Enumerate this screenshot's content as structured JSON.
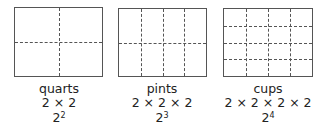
{
  "panels": [
    {
      "name": "quarts",
      "product": "2 × 2",
      "base": "2",
      "exponent": "2",
      "rect": {
        "left": 14,
        "top": 7,
        "width": 89,
        "height": 70
      },
      "cols": 2,
      "rows": 2
    },
    {
      "name": "pints",
      "product": "2 × 2 × 2",
      "base": "2",
      "exponent": "3",
      "rect": {
        "left": 118,
        "top": 8,
        "width": 89,
        "height": 69
      },
      "cols": 4,
      "rows": 2
    },
    {
      "name": "cups",
      "product": "2 × 2 × 2 × 2",
      "base": "2",
      "exponent": "4",
      "rect": {
        "left": 223,
        "top": 8,
        "width": 90,
        "height": 69
      },
      "cols": 4,
      "rows": 4
    }
  ]
}
